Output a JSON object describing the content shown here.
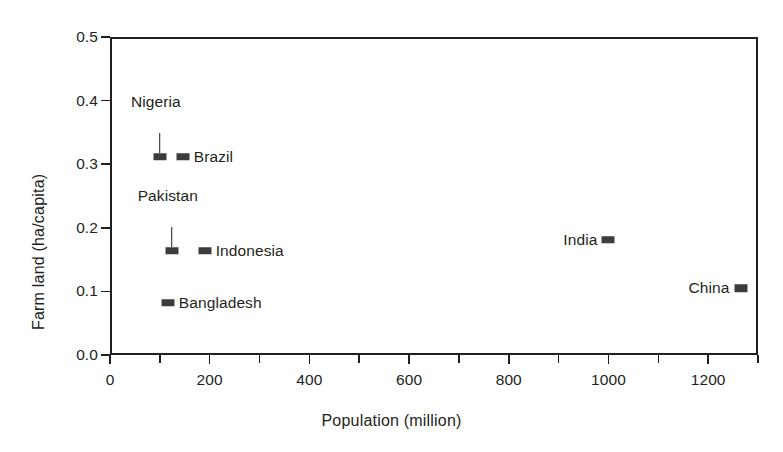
{
  "chart_data": {
    "type": "scatter",
    "title": "",
    "xlabel": "Population (million)",
    "ylabel": "Farm land (ha/capita)",
    "xlim": [
      0,
      1300
    ],
    "ylim": [
      0.0,
      0.5
    ],
    "grid": false,
    "legend": "none",
    "x_ticks": [
      0,
      100,
      200,
      300,
      400,
      500,
      600,
      700,
      800,
      900,
      1000,
      1100,
      1200,
      1300
    ],
    "x_tick_labels": [
      "0",
      "",
      "200",
      "",
      "400",
      "",
      "600",
      "",
      "800",
      "",
      "1000",
      "",
      "1200",
      ""
    ],
    "y_ticks": [
      0.0,
      0.1,
      0.2,
      0.3,
      0.4,
      0.5
    ],
    "y_tick_labels": [
      "0.0",
      "0.1",
      "0.2",
      "0.3",
      "0.4",
      "0.5"
    ],
    "marker_color": "#3c3c3c",
    "axis_color": "#231f20",
    "points": [
      {
        "name": "Nigeria",
        "x": 100,
        "y": 0.312,
        "label_pos": "above",
        "leader": true
      },
      {
        "name": "Brazil",
        "x": 146,
        "y": 0.312,
        "label_pos": "right",
        "leader": false
      },
      {
        "name": "Pakistan",
        "x": 124,
        "y": 0.164,
        "label_pos": "above",
        "leader": true
      },
      {
        "name": "Indonesia",
        "x": 190,
        "y": 0.164,
        "label_pos": "right",
        "leader": false
      },
      {
        "name": "Bangladesh",
        "x": 116,
        "y": 0.082,
        "label_pos": "right",
        "leader": false
      },
      {
        "name": "India",
        "x": 1000,
        "y": 0.181,
        "label_pos": "left",
        "leader": false
      },
      {
        "name": "China",
        "x": 1265,
        "y": 0.105,
        "label_pos": "left",
        "leader": false
      }
    ]
  }
}
